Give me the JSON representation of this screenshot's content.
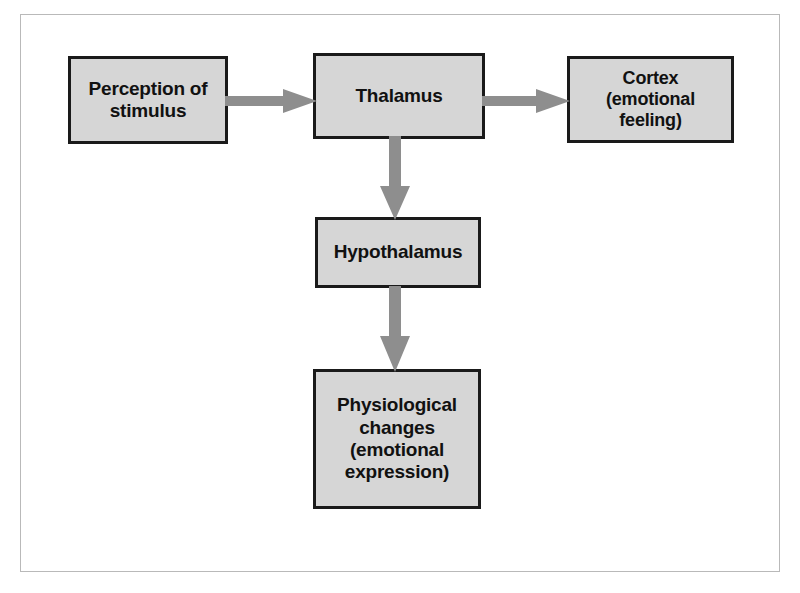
{
  "figure": {
    "background_color": "#ffffff",
    "frame_color": "#b9b9b9",
    "box_fill_color": "#d6d6d6",
    "box_border_color": "#1a1a1a",
    "arrow_color": "#8e8e8e",
    "text_color": "#111111"
  },
  "nodes": [
    {
      "id": "perception",
      "label": "Perception of\nstimulus"
    },
    {
      "id": "thalamus",
      "label": "Thalamus"
    },
    {
      "id": "cortex",
      "label": "Cortex (emotional\nfeeling)"
    },
    {
      "id": "hypothalamus",
      "label": "Hypothalamus"
    },
    {
      "id": "physiological",
      "label": "Physiological\nchanges\n(emotional\nexpression)"
    }
  ],
  "edges": [
    {
      "id": "perception-thalamus",
      "from": "perception",
      "to": "thalamus",
      "direction": "right"
    },
    {
      "id": "thalamus-cortex",
      "from": "thalamus",
      "to": "cortex",
      "direction": "right"
    },
    {
      "id": "thalamus-hypo",
      "from": "thalamus",
      "to": "hypothalamus",
      "direction": "down"
    },
    {
      "id": "hypo-physio",
      "from": "hypothalamus",
      "to": "physiological",
      "direction": "down"
    }
  ]
}
